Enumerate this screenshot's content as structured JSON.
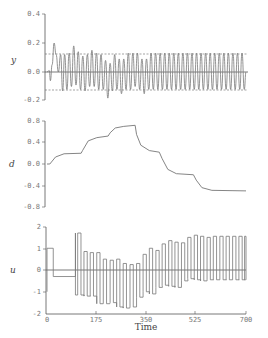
{
  "chart_data": [
    {
      "type": "line",
      "title": "",
      "xlabel": "",
      "ylabel": "y",
      "ylim": [
        -0.2,
        0.4
      ],
      "yticks": [
        "0.4",
        "0.2",
        "0.0",
        "-0.2"
      ],
      "xlim": [
        0,
        700
      ],
      "reference_lines": [
        {
          "y": 0.125,
          "style": "dashed"
        },
        {
          "y": -0.125,
          "style": "dashed"
        },
        {
          "y": 0.0,
          "style": "solid"
        }
      ],
      "description": "Oscillating output around 0 with amplitude ~0.12-0.18, initial dip to -0.06 then peak 0.2 near t~25",
      "series": [
        {
          "name": "y",
          "x": [
            0,
            8,
            12,
            18,
            25,
            32,
            40,
            48,
            55,
            62,
            70,
            78,
            86,
            94,
            102,
            110,
            118,
            126,
            134,
            142,
            150,
            158,
            166,
            174,
            182,
            190,
            198,
            206,
            214,
            222,
            230,
            238,
            246,
            254,
            262,
            270,
            278,
            286,
            294,
            302,
            310,
            318,
            326,
            334,
            342,
            350,
            358,
            366,
            374,
            382,
            390,
            398,
            406,
            414,
            422,
            430,
            438,
            446,
            454,
            462,
            470,
            478,
            486,
            494,
            502,
            510,
            518,
            526,
            534,
            542,
            550,
            558,
            566,
            574,
            582,
            590,
            598,
            606,
            614,
            622,
            630,
            638,
            646,
            654,
            662,
            670,
            678,
            686,
            694,
            700
          ],
          "values": [
            0,
            0.01,
            -0.06,
            0.05,
            0.2,
            0.12,
            0.0,
            0.12,
            -0.13,
            0.12,
            -0.12,
            0.13,
            -0.1,
            0.18,
            -0.09,
            0.14,
            -0.12,
            0.11,
            -0.13,
            0.12,
            -0.1,
            0.15,
            -0.1,
            0.13,
            -0.12,
            0.12,
            -0.12,
            0.08,
            -0.18,
            0.06,
            -0.13,
            0.12,
            -0.12,
            0.09,
            -0.15,
            0.09,
            -0.12,
            0.13,
            -0.12,
            0.13,
            -0.1,
            0.13,
            -0.12,
            0.09,
            -0.15,
            0.09,
            -0.12,
            0.13,
            -0.12,
            0.13,
            -0.12,
            0.13,
            -0.12,
            0.13,
            -0.12,
            0.13,
            -0.12,
            0.13,
            -0.12,
            0.13,
            -0.12,
            0.13,
            -0.12,
            0.13,
            -0.12,
            0.13,
            -0.12,
            0.13,
            -0.12,
            0.13,
            -0.12,
            0.13,
            -0.12,
            0.13,
            -0.12,
            0.13,
            -0.12,
            0.13,
            -0.12,
            0.13,
            -0.12,
            0.13,
            -0.12,
            0.13,
            -0.12,
            0.13,
            -0.12,
            0.13,
            -0.12,
            0.0
          ]
        }
      ]
    },
    {
      "type": "line",
      "title": "",
      "xlabel": "",
      "ylabel": "d",
      "ylim": [
        -0.8,
        0.8
      ],
      "yticks": [
        "0.8",
        "0.4",
        "0.0",
        "-0.4",
        "-0.8"
      ],
      "xlim": [
        0,
        700
      ],
      "description": "Piecewise step-like disturbance estimate with exponential transitions",
      "series": [
        {
          "name": "d",
          "x": [
            0,
            10,
            30,
            60,
            120,
            125,
            145,
            175,
            215,
            222,
            240,
            270,
            310,
            315,
            330,
            360,
            395,
            405,
            425,
            455,
            515,
            525,
            545,
            580,
            700
          ],
          "values": [
            0,
            0.0,
            0.13,
            0.19,
            0.2,
            0.25,
            0.43,
            0.49,
            0.52,
            0.58,
            0.67,
            0.7,
            0.72,
            0.55,
            0.35,
            0.25,
            0.22,
            0.1,
            -0.1,
            -0.18,
            -0.2,
            -0.3,
            -0.44,
            -0.49,
            -0.5
          ]
        }
      ]
    },
    {
      "type": "line",
      "title": "",
      "xlabel": "Time",
      "ylabel": "u",
      "ylim": [
        -2,
        2
      ],
      "yticks": [
        "2",
        "1",
        "0",
        "-1",
        "-2"
      ],
      "xlim": [
        0,
        700
      ],
      "xticks": [
        "0",
        "175",
        "350",
        "525",
        "700"
      ],
      "description": "Switching control input (square wave) with growing amplitude and shifting offset",
      "series": [
        {
          "name": "u_high",
          "x": [
            5,
            45,
            108,
            130,
            152,
            175,
            198,
            222,
            245,
            268,
            292,
            315,
            338,
            360,
            383,
            405,
            428,
            450,
            473,
            495,
            518,
            540,
            563,
            585,
            608,
            630,
            653,
            675,
            695
          ],
          "values": [
            1.0,
            0.0,
            1.7,
            0.85,
            0.8,
            0.8,
            0.5,
            0.45,
            0.5,
            0.3,
            0.25,
            0.3,
            0.72,
            1.0,
            0.9,
            1.2,
            1.35,
            1.28,
            1.25,
            1.5,
            1.6,
            1.55,
            1.5,
            1.55,
            1.55,
            1.55,
            1.55,
            1.55,
            1.55
          ]
        },
        {
          "name": "u_low",
          "x": [
            5,
            45,
            108,
            130,
            152,
            175,
            198,
            222,
            245,
            268,
            292,
            315,
            338,
            360,
            383,
            405,
            428,
            450,
            473,
            495,
            518,
            540,
            563,
            585,
            608,
            630,
            653,
            675,
            695
          ],
          "values": [
            -1.0,
            -0.3,
            -1.15,
            -1.2,
            -1.2,
            -1.55,
            -1.55,
            -1.5,
            -1.7,
            -1.75,
            -1.7,
            -1.25,
            -1.0,
            -1.1,
            -0.8,
            -0.7,
            -0.75,
            -0.8,
            -0.5,
            -0.4,
            -0.45,
            -0.5,
            -0.45,
            -0.45,
            -0.45,
            -0.45,
            -0.45,
            -0.45,
            -0.45
          ]
        }
      ]
    }
  ],
  "labels": {
    "top_ylabel": "y",
    "mid_ylabel": "d",
    "bot_ylabel": "u",
    "xlabel": "Time",
    "top_ticks": [
      "0.4",
      "0.2",
      "0.0",
      "-0.2"
    ],
    "mid_ticks": [
      "0.8",
      "0.4",
      "0.0",
      "-0.4",
      "-0.8"
    ],
    "bot_ticks": [
      "2",
      "1",
      "0",
      "-1",
      "-2"
    ],
    "x_ticks": [
      "0",
      "175",
      "350",
      "525",
      "700"
    ]
  }
}
